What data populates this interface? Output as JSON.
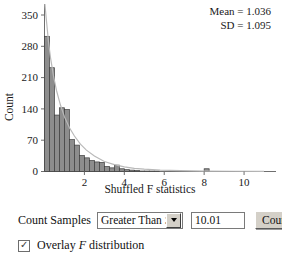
{
  "chart_data": {
    "type": "bar",
    "title": "",
    "xlabel": "Shuffled F statistics",
    "ylabel": "Count",
    "xlim": [
      0,
      11.6
    ],
    "ylim": [
      0,
      368
    ],
    "xticks": [
      2,
      4,
      6,
      8,
      10
    ],
    "yticks": [
      0,
      70,
      140,
      210,
      280,
      350
    ],
    "grid": false,
    "bin_width": 0.25,
    "bin_starts": [
      0.0,
      0.25,
      0.5,
      0.75,
      1.0,
      1.25,
      1.5,
      1.75,
      2.0,
      2.25,
      2.5,
      2.75,
      3.0,
      3.25,
      3.5,
      3.75,
      4.0,
      4.25,
      4.5,
      4.75,
      5.0,
      5.25,
      5.5,
      5.75,
      6.0,
      6.25,
      6.5,
      6.75,
      7.0,
      7.25,
      7.5,
      7.75,
      8.0,
      8.25,
      8.5,
      8.75,
      9.0,
      9.25,
      9.5,
      9.75,
      10.0
    ],
    "values": [
      297,
      228,
      124,
      140,
      136,
      70,
      58,
      35,
      30,
      24,
      21,
      20,
      11,
      8,
      14,
      6,
      4,
      3,
      2,
      1,
      1,
      1,
      1,
      0,
      0,
      0,
      0,
      0,
      0,
      0,
      0,
      0,
      6,
      0,
      0,
      0,
      0,
      0,
      0,
      0,
      0
    ],
    "overlay_curve": {
      "name": "F distribution",
      "visible": true,
      "peak_value": 368,
      "x": [
        0.02,
        0.1,
        0.2,
        0.3,
        0.45,
        0.6,
        0.8,
        1.0,
        1.25,
        1.5,
        1.8,
        2.1,
        2.5,
        3.0,
        3.5,
        4.0,
        4.5,
        5.0,
        5.8,
        6.8,
        8.0,
        9.5,
        11.0
      ],
      "y": [
        368,
        330,
        285,
        250,
        210,
        178,
        146,
        120,
        96,
        78,
        60,
        47,
        34,
        22,
        15,
        10,
        7,
        5,
        3,
        2,
        1,
        0.5,
        0.3
      ]
    },
    "annotations": {
      "mean_label": "Mean = 1.036",
      "sd_label": "SD = 1.095"
    },
    "colors": {
      "bar_fill": "#8d8d8d",
      "bar_edge": "#3c3c3c",
      "curve": "#b9b9b9",
      "axis": "#6f6f6f",
      "text": "#1a1a1a"
    }
  },
  "controls": {
    "count_samples_label": "Count Samples",
    "comparison_select": {
      "selected": "Greater Than ≥",
      "options": [
        "Greater Than ≥",
        "Less Than ≤",
        "Equal To ="
      ]
    },
    "threshold_input": {
      "value": "10.01",
      "placeholder": ""
    },
    "count_button_label": "Count",
    "overlay_checkbox": {
      "checked": true,
      "check_glyph": "✓",
      "label_prefix": "Overlay ",
      "label_italic": "F",
      "label_suffix": " distribution"
    }
  }
}
